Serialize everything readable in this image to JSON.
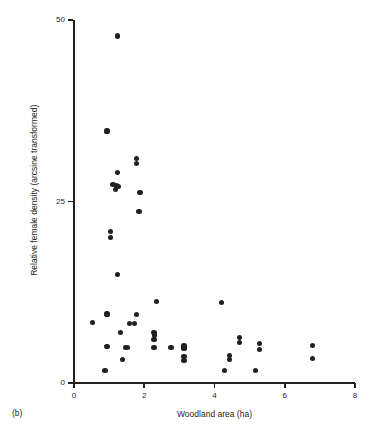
{
  "figure": {
    "panel_label": "(b)",
    "background_color": "#ffffff",
    "marker_color": "#231f20",
    "axis_color": "#231f20"
  },
  "chart_data": {
    "type": "scatter",
    "title": "",
    "subtitle": "",
    "xlabel": "Woodland area (ha)",
    "ylabel": "Relative female density (arcsine transformed)",
    "xlim": [
      0,
      8
    ],
    "ylim": [
      0,
      50
    ],
    "xticks": [
      0,
      2,
      4,
      6,
      8
    ],
    "yticks": [
      0,
      25,
      50
    ],
    "xtick_labels": [
      "0",
      "2",
      "4",
      "6",
      "8"
    ],
    "ytick_labels": [
      "0",
      "25",
      "50"
    ],
    "grid": false,
    "legend": null,
    "annotations": [],
    "series": [
      {
        "name": "Woodland sites",
        "marker": "filled-circle",
        "color": "#231f20",
        "points": [
          [
            1.23,
            47.8
          ],
          [
            0.94,
            34.7
          ],
          [
            1.79,
            30.9
          ],
          [
            1.79,
            30.2
          ],
          [
            1.23,
            29.0
          ],
          [
            1.11,
            27.3
          ],
          [
            1.2,
            27.2
          ],
          [
            1.26,
            27.1
          ],
          [
            1.19,
            26.6
          ],
          [
            1.88,
            26.2
          ],
          [
            1.85,
            23.6
          ],
          [
            1.05,
            20.9
          ],
          [
            1.05,
            20.0
          ],
          [
            1.23,
            15.0
          ],
          [
            2.34,
            11.2
          ],
          [
            4.2,
            11.1
          ],
          [
            0.94,
            9.5
          ],
          [
            1.79,
            9.4
          ],
          [
            0.52,
            8.3
          ],
          [
            1.57,
            8.2
          ],
          [
            1.72,
            8.2
          ],
          [
            2.28,
            7.0
          ],
          [
            1.33,
            6.9
          ],
          [
            2.3,
            6.6
          ],
          [
            2.28,
            6.0
          ],
          [
            4.72,
            6.3
          ],
          [
            4.72,
            5.6
          ],
          [
            0.94,
            5.0
          ],
          [
            1.46,
            4.9
          ],
          [
            1.53,
            4.9
          ],
          [
            2.28,
            4.9
          ],
          [
            2.76,
            4.9
          ],
          [
            3.13,
            5.1
          ],
          [
            3.13,
            4.7
          ],
          [
            5.28,
            5.4
          ],
          [
            5.28,
            4.6
          ],
          [
            6.78,
            5.2
          ],
          [
            1.39,
            3.2
          ],
          [
            3.13,
            3.6
          ],
          [
            3.13,
            3.1
          ],
          [
            4.42,
            3.8
          ],
          [
            4.42,
            3.2
          ],
          [
            6.78,
            3.4
          ],
          [
            0.88,
            1.7
          ],
          [
            4.28,
            1.7
          ],
          [
            5.16,
            1.7
          ]
        ]
      }
    ]
  }
}
